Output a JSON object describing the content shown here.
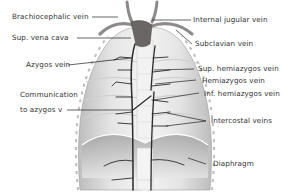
{
  "diagram": {
    "labels_left": [
      {
        "id": "brachiocephalic",
        "text": "Brachiocephalic vein"
      },
      {
        "id": "svc",
        "text": "Sup. vena cava"
      },
      {
        "id": "azygos",
        "text": "Azygos vein"
      },
      {
        "id": "communication_1",
        "text": "Communication"
      },
      {
        "id": "communication_2",
        "text": "to azygos v"
      }
    ],
    "labels_right": [
      {
        "id": "ijv",
        "text": "Internal jugular vein"
      },
      {
        "id": "subclavian",
        "text": "Subclavian vein"
      },
      {
        "id": "sup_hemiazygos",
        "text": "Sup. hemiazygos vein"
      },
      {
        "id": "hemiazygos",
        "text": "Hemiazygos vein"
      },
      {
        "id": "inf_hemiazygos",
        "text": "Inf. hemiazygos vein"
      },
      {
        "id": "intercostal",
        "text": "Intercostal veins"
      },
      {
        "id": "diaphragm",
        "text": "Diaphragm"
      }
    ],
    "colors": {
      "vein": "#2e2a2a",
      "tissue_light": "#ececec",
      "tissue_mid": "#cfcfcf",
      "leader_line": "#222222",
      "label_text": "#333333"
    }
  }
}
